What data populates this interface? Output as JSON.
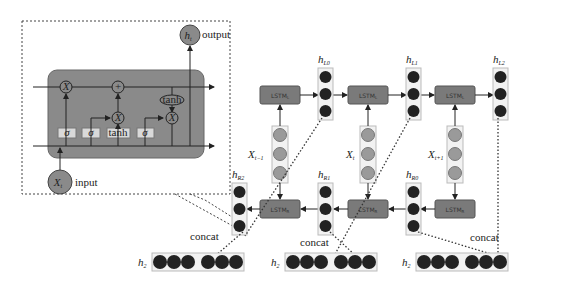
{
  "diagram": {
    "inset": {
      "cell_ops": {
        "mult": "X",
        "add": "+",
        "sigma": "σ",
        "tanh": "tanh"
      },
      "output_node": "h",
      "output_sub": "t",
      "output_label": "output",
      "input_node": "X",
      "input_sub": "t",
      "input_label": "input"
    },
    "forward": {
      "cell_label": "LSTM",
      "cell_sub": "L",
      "states": [
        {
          "name": "h",
          "sub": "L0"
        },
        {
          "name": "h",
          "sub": "L1"
        },
        {
          "name": "h",
          "sub": "L2"
        }
      ]
    },
    "backward": {
      "cell_label": "LSTM",
      "cell_sub": "R",
      "states": [
        {
          "name": "h",
          "sub": "R2"
        },
        {
          "name": "h",
          "sub": "R1"
        },
        {
          "name": "h",
          "sub": "R0"
        }
      ]
    },
    "inputs": [
      {
        "name": "X",
        "sub": "t−1"
      },
      {
        "name": "X",
        "sub": "t"
      },
      {
        "name": "X",
        "sub": "t+1"
      }
    ],
    "concat_label": "concat",
    "outputs": [
      {
        "name": "h",
        "sub": "2"
      },
      {
        "name": "h",
        "sub": "2"
      },
      {
        "name": "h",
        "sub": "2"
      }
    ],
    "colors": {
      "cell_fill": "#7a7a7a",
      "inset_cell_fill": "#8a8a8a",
      "hidden_node": "#222222",
      "input_node": "#9a9a9a",
      "gate_box": "#d9d9d9"
    }
  }
}
